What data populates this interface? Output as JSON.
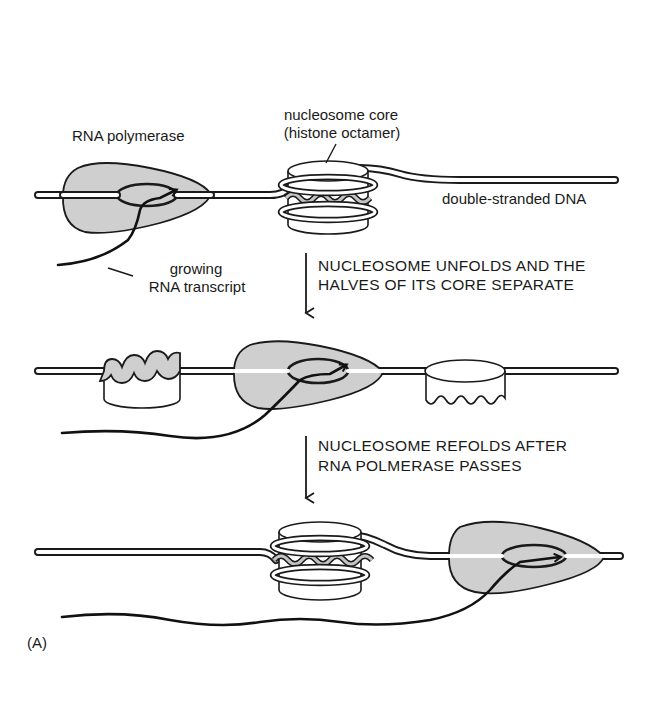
{
  "figure": {
    "panel_label": "(A)",
    "stage1": {
      "labels": {
        "polymerase": "RNA polymerase",
        "nucleosome_line1": "nucleosome core",
        "nucleosome_line2": "(histone octamer)",
        "dna": "double-stranded DNA",
        "rna_line1": "growing",
        "rna_line2": "RNA transcript"
      }
    },
    "step1": {
      "line1": "NUCLEOSOME UNFOLDS AND THE",
      "line2": "HALVES OF ITS CORE SEPARATE"
    },
    "step2": {
      "line1": "NUCLEOSOME REFOLDS AFTER",
      "line2": "RNA POLMERASE PASSES"
    },
    "colors": {
      "ink": "#1a1a1a",
      "polymerase_fill": "#cfcfcf",
      "background": "#ffffff"
    }
  }
}
